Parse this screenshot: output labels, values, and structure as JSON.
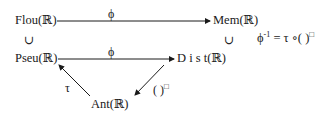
{
  "nodes": {
    "flou": "Flou(ℝ)",
    "mem": "Mem(ℝ)",
    "pseu": "Pseu(ℝ)",
    "dist": "D i s t(ℝ)",
    "ant": "Ant(ℝ)"
  },
  "edges": {
    "top": "ϕ",
    "middle": "ϕ",
    "left_diag": "τ",
    "right_diag": "( )",
    "right_diag_sup": "□"
  },
  "inclusions": {
    "left": "∪",
    "right": "∪"
  },
  "equation": {
    "lhs": "ϕ",
    "lhs_sup": "-1",
    "rhs": "= τ ∘( )",
    "rhs_sup": "□"
  }
}
